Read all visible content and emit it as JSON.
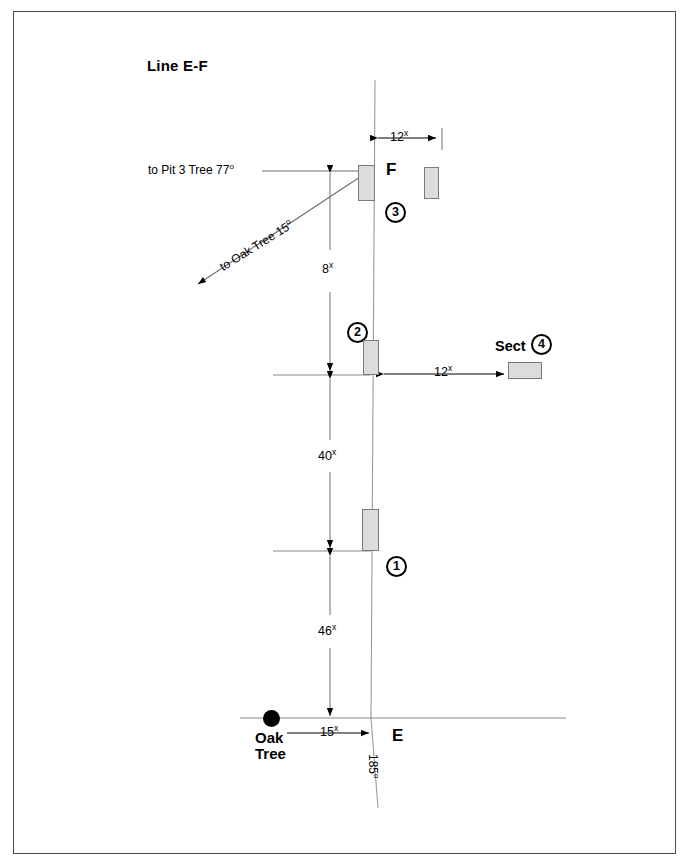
{
  "diagram": {
    "title": "Line E-F",
    "points": {
      "f_label": "F",
      "e_label": "E"
    },
    "features": {
      "oak_tree_line1": "Oak",
      "oak_tree_line2": "Tree",
      "sect_label": "Sect"
    },
    "bearings": [
      {
        "name": "to-pit-3-tree",
        "text": "to Pit 3 Tree 77",
        "degree": "o"
      },
      {
        "name": "to-oak-tree",
        "text": "to Oak Tree 15",
        "degree": "o"
      },
      {
        "name": "line-bearing",
        "text": "185",
        "degree": "o"
      }
    ],
    "dimensions": [
      {
        "name": "top-offset",
        "value": "12",
        "unit": "x"
      },
      {
        "name": "f-to-sect2",
        "value": "8",
        "unit": "x"
      },
      {
        "name": "sect2-to-sect1",
        "value": "40",
        "unit": "x"
      },
      {
        "name": "sect1-to-e",
        "value": "46",
        "unit": "x"
      },
      {
        "name": "sect2-offset",
        "value": "12",
        "unit": "x"
      },
      {
        "name": "oak-to-e",
        "value": "15",
        "unit": "x"
      }
    ],
    "section_numbers": [
      {
        "name": "section-1",
        "value": "1"
      },
      {
        "name": "section-2",
        "value": "2"
      },
      {
        "name": "section-3",
        "value": "3"
      },
      {
        "name": "section-4",
        "value": "4"
      }
    ],
    "colors": {
      "unit_fill": "#dcdcdc",
      "unit_stroke": "#7b7b7b",
      "line": "#8a8a8a",
      "ink": "#000000",
      "border": "#4a4a4a"
    }
  }
}
